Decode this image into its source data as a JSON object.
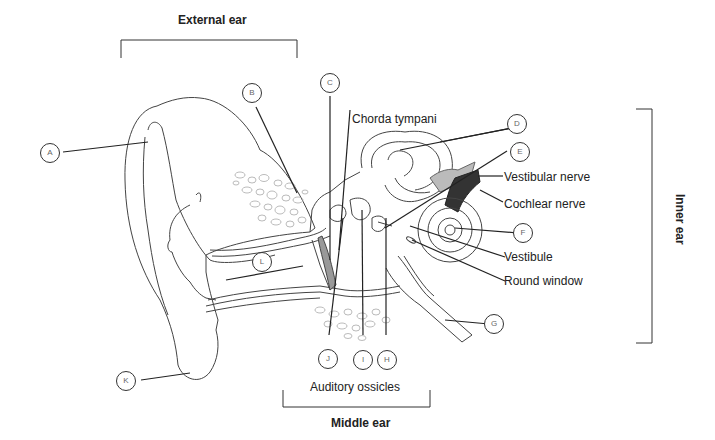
{
  "diagram": {
    "type": "anatomy-labeling",
    "regions": {
      "external": "External ear",
      "middle": "Middle ear",
      "inner": "Inner ear"
    },
    "text_labels": {
      "chorda": "Chorda tympani",
      "vestibular": "Vestibular nerve",
      "cochlear": "Cochlear nerve",
      "vestibule": "Vestibule",
      "round": "Round window",
      "ossicles": "Auditory ossicles"
    },
    "markers": {
      "A": "A",
      "B": "B",
      "C": "C",
      "D": "D",
      "E": "E",
      "F": "F",
      "G": "G",
      "H": "H",
      "I": "I",
      "J": "J",
      "K": "K",
      "L": "L"
    }
  }
}
